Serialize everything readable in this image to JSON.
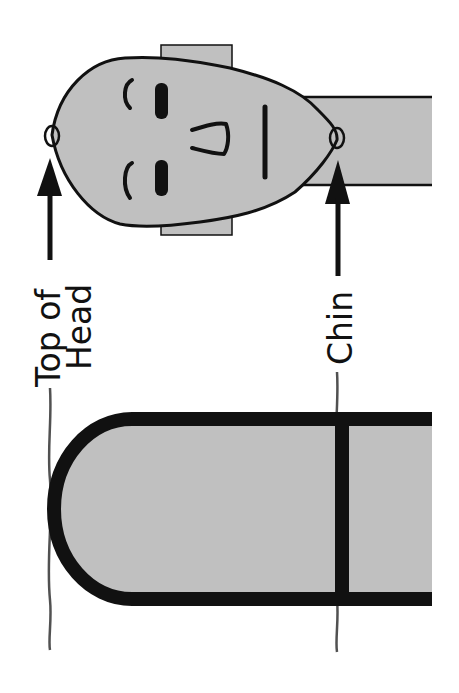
{
  "diagram": {
    "labels": {
      "top_of_head_line1": "Top of",
      "top_of_head_line2": "Head",
      "chin": "Chin"
    },
    "colors": {
      "fill": "#c0c0c0",
      "stroke": "#111111",
      "background": "#ffffff"
    },
    "orientation": "rotated 90° counter-clockwise"
  }
}
